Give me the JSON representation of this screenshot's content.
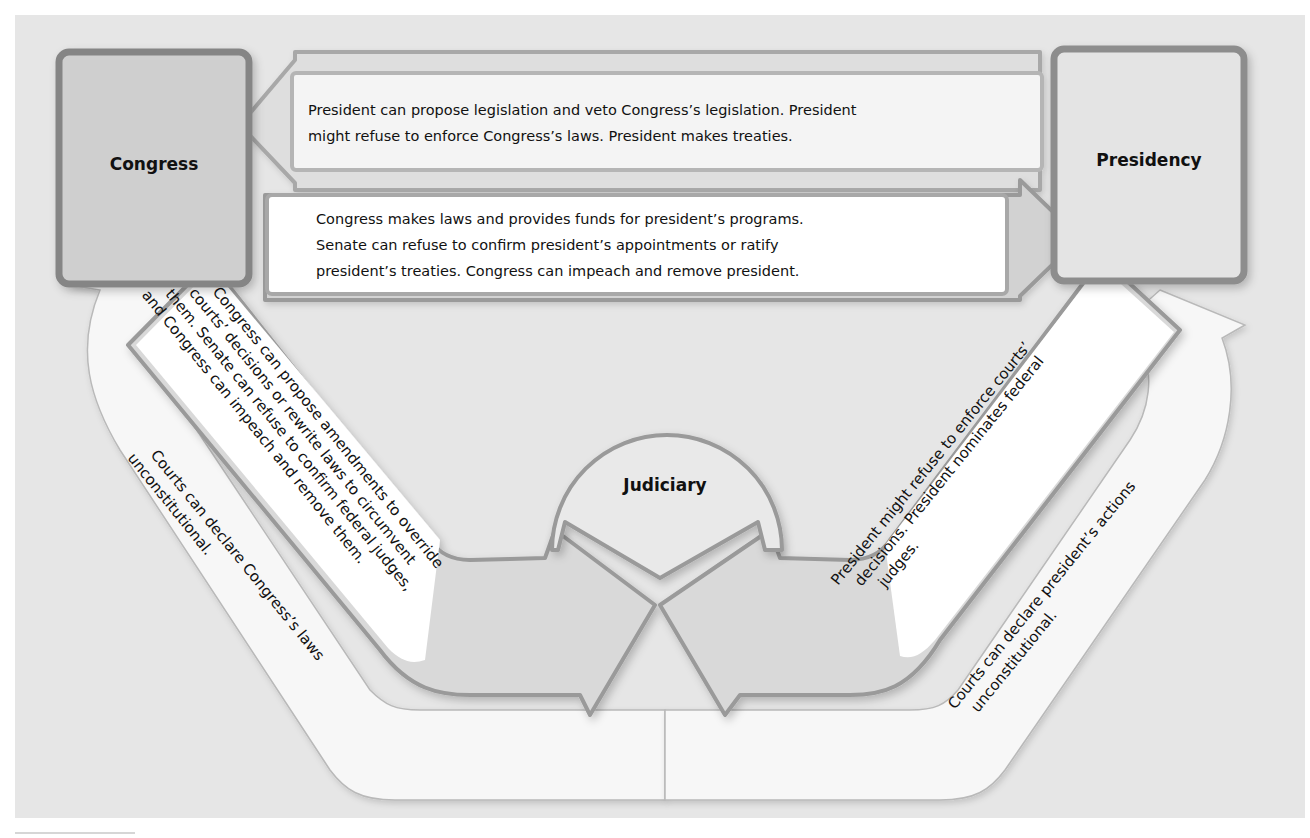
{
  "diagram": {
    "type": "checks-and-balances",
    "colors": {
      "background_panel": "#e6e6e6",
      "box_border": "#8a8a8a",
      "congress_fill": "#cfcfcf",
      "presidency_fill": "#e4e4e4",
      "arrow_fill": "#dcdcdc",
      "text_box_fill": "#ffffff",
      "text": "#111111"
    },
    "nodes": {
      "congress": {
        "label": "Congress"
      },
      "presidency": {
        "label": "Presidency"
      },
      "judiciary": {
        "label": "Judiciary"
      }
    },
    "arrows": {
      "president_to_congress": {
        "from": "Presidency",
        "to": "Congress",
        "lines": [
          "President can propose legislation and veto Congress’s legislation. President",
          "might refuse to enforce Congress’s laws. President makes treaties."
        ]
      },
      "congress_to_president": {
        "from": "Congress",
        "to": "Presidency",
        "lines": [
          "Congress makes laws and provides funds for president’s programs.",
          "Senate can refuse to confirm president’s appointments or ratify",
          "president’s treaties. Congress can impeach and remove president."
        ]
      },
      "congress_to_judiciary": {
        "from": "Congress",
        "to": "Judiciary",
        "lines": [
          "Congress can propose amendments to override",
          "courts’ decisions or rewrite laws to circumvent",
          "them. Senate can refuse to confirm federal judges,",
          "and Congress can impeach and remove them."
        ]
      },
      "president_to_judiciary": {
        "from": "Presidency",
        "to": "Judiciary",
        "lines": [
          "President might refuse to enforce courts’",
          "decisions. President nominates federal",
          "judges."
        ]
      },
      "judiciary_to_congress": {
        "from": "Judiciary",
        "to": "Congress",
        "lines": [
          "Courts can declare Congress’s laws",
          "unconstitutional."
        ]
      },
      "judiciary_to_president": {
        "from": "Judiciary",
        "to": "Presidency",
        "lines": [
          "Courts can declare president’s actions",
          "unconstitutional."
        ]
      }
    }
  }
}
